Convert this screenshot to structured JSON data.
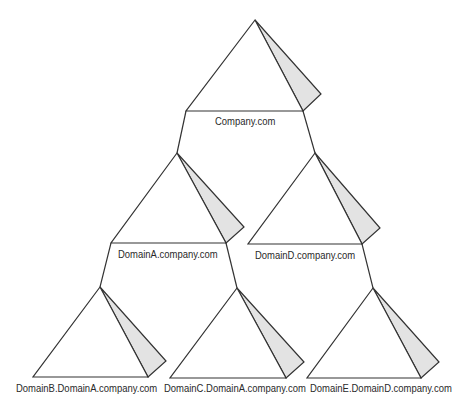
{
  "diagram": {
    "type": "domain-tree",
    "colors": {
      "line": "#333333",
      "shade": "#e3e3e3",
      "background": "#ffffff",
      "text": "#2a2a2a"
    },
    "nodes": [
      {
        "id": "company",
        "label": "Company.com",
        "level": 0,
        "parent": null
      },
      {
        "id": "domainA",
        "label": "DomainA.company.com",
        "level": 1,
        "parent": "company"
      },
      {
        "id": "domainD",
        "label": "DomainD.company.com",
        "level": 1,
        "parent": "company"
      },
      {
        "id": "domainB",
        "label": "DomainB.DomainA.company.com",
        "level": 2,
        "parent": "domainA"
      },
      {
        "id": "domainC",
        "label": "DomainC.DomainA.company.com",
        "level": 2,
        "parent": "domainA"
      },
      {
        "id": "domainE",
        "label": "DomainE.DomainD.company.com",
        "level": 2,
        "parent": "domainD"
      }
    ],
    "edges": [
      {
        "from": "company",
        "to": "domainA"
      },
      {
        "from": "company",
        "to": "domainD"
      },
      {
        "from": "domainA",
        "to": "domainB"
      },
      {
        "from": "domainA",
        "to": "domainC"
      },
      {
        "from": "domainD",
        "to": "domainE"
      }
    ]
  }
}
